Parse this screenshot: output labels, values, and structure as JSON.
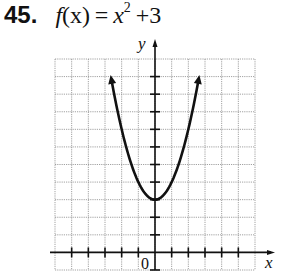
{
  "problem": {
    "number": "45.",
    "fn": "f",
    "arg": "(x)",
    "equals": "=",
    "base": "x",
    "exponent": "2",
    "rest": "+3"
  },
  "labels": {
    "x_axis": "x",
    "y_axis": "y",
    "origin": "0"
  },
  "colors": {
    "grid": "#8a8a8a",
    "axis": "#111111",
    "curve": "#111111"
  },
  "chart_data": {
    "type": "line",
    "xlabel": "x",
    "ylabel": "y",
    "xlim": [
      -6,
      6
    ],
    "ylim": [
      -1,
      11
    ],
    "grid": true,
    "tick_spacing": 1,
    "function": "x^2 + 3",
    "vertex": [
      0,
      3
    ],
    "x": [
      -2.6,
      -2,
      -1.5,
      -1,
      -0.5,
      0,
      0.5,
      1,
      1.5,
      2,
      2.6
    ],
    "y": [
      9.76,
      7,
      5.25,
      4,
      3.25,
      3,
      3.25,
      4,
      5.25,
      7,
      9.76
    ],
    "arrows_at_ends": true,
    "legend": []
  }
}
